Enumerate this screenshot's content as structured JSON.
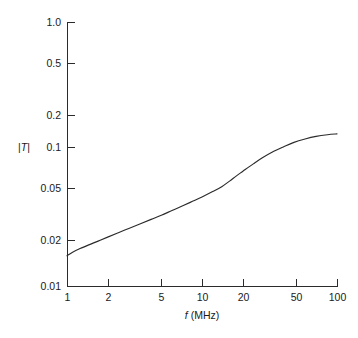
{
  "chart_data": {
    "type": "line",
    "title": "",
    "subtitle": "",
    "xlabel": "f (MHz)",
    "xlabel_italic_part": "f",
    "xlabel_rest": "(MHz)",
    "ylabel": "|T|",
    "ylabel_italic_part": "T",
    "xscale": "log",
    "yscale": "log",
    "xlim": [
      1,
      100
    ],
    "ylim": [
      0.01,
      1.0
    ],
    "grid": false,
    "legend": null,
    "xticks": [
      1,
      2,
      5,
      10,
      20,
      50,
      100
    ],
    "xtick_labels": [
      "1",
      "2",
      "5",
      "10",
      "20",
      "50",
      "100"
    ],
    "yticks": [
      0.01,
      0.02,
      0.05,
      0.1,
      0.2,
      0.5,
      1.0
    ],
    "ytick_labels": [
      "0.01",
      "0.02",
      "0.05",
      "0.1",
      "0.2",
      "0.5",
      "1.0"
    ],
    "series": [
      {
        "name": "|T|",
        "x": [
          1.0,
          1.1,
          1.25,
          1.45,
          1.7,
          2.0,
          2.4,
          2.9,
          3.5,
          4.2,
          5.0,
          6.0,
          7.2,
          8.5,
          10.0,
          12.0,
          14.0,
          16.0,
          18.0,
          20.0,
          24.0,
          28.0,
          33.0,
          40.0,
          48.0,
          58.0,
          70.0,
          85.0,
          100.0
        ],
        "y": [
          0.0172,
          0.0183,
          0.0195,
          0.0208,
          0.0222,
          0.0238,
          0.0257,
          0.0278,
          0.03,
          0.0324,
          0.0348,
          0.0378,
          0.041,
          0.0443,
          0.0478,
          0.0525,
          0.0572,
          0.063,
          0.069,
          0.0745,
          0.085,
          0.0945,
          0.104,
          0.114,
          0.1235,
          0.131,
          0.137,
          0.141,
          0.143
        ]
      }
    ],
    "annotations": []
  },
  "axes": {
    "plot_left_px": 67,
    "plot_right_px": 337,
    "plot_top_px": 22,
    "plot_bottom_px": 287
  }
}
